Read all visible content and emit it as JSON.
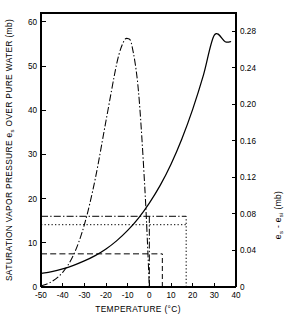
{
  "chart_data": {
    "type": "line",
    "title": "",
    "xlabel": "TEMPERATURE  (°C)",
    "ylabel_left": "SATURATION VAPOR PRESSURE e",
    "ylabel_left_sub": "s",
    "ylabel_left_tail": " OVER PURE WATER  (mb)",
    "ylabel_right": "e",
    "ylabel_right_sub1": "s",
    "ylabel_right_mid": " - e",
    "ylabel_right_sub2": "si",
    "ylabel_right_tail": "  (mb)",
    "xlim": [
      -50,
      40
    ],
    "ylim_left": [
      0,
      62
    ],
    "ylim_right": [
      0,
      0.3
    ],
    "grid": false,
    "legend": "none",
    "x_ticks": [
      -50,
      -40,
      -30,
      -20,
      -10,
      0,
      10,
      20,
      30,
      40
    ],
    "x_tick_labels": [
      "-50",
      "-40",
      "-30",
      "-20",
      "-10",
      "0",
      "10",
      "20",
      "30",
      "40"
    ],
    "y_ticks_left": [
      0,
      10,
      20,
      30,
      40,
      50,
      60
    ],
    "y_tick_labels_left": [
      "0",
      "10",
      "20",
      "30",
      "40",
      "50",
      "60"
    ],
    "y_ticks_right": [
      0,
      0.04,
      0.08,
      0.12,
      0.16,
      0.2,
      0.24,
      0.28
    ],
    "y_tick_labels_right": [
      "0",
      "0.04",
      "0.08",
      "0.12",
      "0.16",
      "0.20",
      "0.24",
      "0.28"
    ],
    "series": [
      {
        "name": "saturation vapor pressure over pure water (es)",
        "style": "solid",
        "axis": "left",
        "x": [
          -50,
          -45,
          -40,
          -35,
          -30,
          -25,
          -20,
          -15,
          -10,
          -5,
          0,
          5,
          10,
          15,
          20,
          25,
          30,
          35,
          37.5
        ],
        "y": [
          3.1,
          3.6,
          4.3,
          5.3,
          6.6,
          8.4,
          10.7,
          13.6,
          17.2,
          21.7,
          27.2,
          33.8,
          41.6,
          50.9,
          61.8,
          74.5,
          89.3,
          106.3,
          116.0
        ],
        "y_plotted": [
          3.1,
          3.5,
          4.1,
          4.9,
          5.9,
          7.1,
          8.6,
          10.5,
          12.8,
          15.6,
          19.0,
          23.0,
          27.8,
          33.5,
          40.2,
          48.0,
          57.0,
          55.5,
          55.5
        ],
        "note": "solid monotonic curve rising from ~3 mb at -50 C to ~55.5 mb at ~37.5 C"
      },
      {
        "name": "es - esi (difference, water minus ice)",
        "style": "dash-dot",
        "axis": "right",
        "x": [
          -50,
          -45,
          -40,
          -35,
          -30,
          -25,
          -20,
          -15,
          -12,
          -10,
          -8,
          -5,
          -2,
          0
        ],
        "y": [
          0.001,
          0.006,
          0.016,
          0.035,
          0.068,
          0.118,
          0.182,
          0.245,
          0.268,
          0.272,
          0.264,
          0.214,
          0.105,
          0.0
        ],
        "note": "hump curve peaking near -11 C at ~0.272 mb, dropping to 0 at 0 C"
      },
      {
        "name": "reference level upper (dash-dot horizontal)",
        "style": "dash-dot-horizontal",
        "axis": "left",
        "y_value": 16.0,
        "x_range": [
          -50,
          17
        ],
        "note": "horizontal dash-dot line at 16 mb spanning from left axis to ~17 C"
      },
      {
        "name": "reference level middle (dotted horizontal)",
        "style": "dotted-horizontal",
        "axis": "left",
        "y_value": 14.1,
        "x_range": [
          -50,
          17
        ],
        "note": "horizontal dotted line at ~14 mb"
      },
      {
        "name": "reference level lower (dashed horizontal)",
        "style": "dashed-horizontal",
        "axis": "left",
        "y_value": 7.5,
        "x_range": [
          -50,
          6
        ],
        "note": "horizontal dashed line at ~7.5 mb terminating at ~6 C"
      },
      {
        "name": "drop line at 0 C (dash-dot vertical)",
        "style": "dash-dot-vertical",
        "x_value": 0,
        "y_range": [
          0,
          16.0
        ]
      },
      {
        "name": "drop line at 6 C (dashed vertical)",
        "style": "dashed-vertical",
        "x_value": 6,
        "y_range": [
          0,
          7.5
        ]
      },
      {
        "name": "drop line at 17 C (dotted vertical)",
        "style": "dotted-vertical",
        "x_value": 17,
        "y_range": [
          0,
          16.0
        ]
      }
    ]
  },
  "colors": {
    "ink": "#000000",
    "background": "#ffffff"
  }
}
